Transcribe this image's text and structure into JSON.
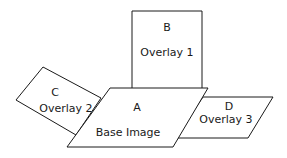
{
  "diagram": {
    "shapes": {
      "a": {
        "letter": "A",
        "label": "Base Image"
      },
      "b": {
        "letter": "B",
        "label": "Overlay 1"
      },
      "c": {
        "letter": "C",
        "label": "Overlay 2"
      },
      "d": {
        "letter": "D",
        "label": "Overlay 3"
      }
    },
    "colors": {
      "stroke": "#1a1a1a",
      "fill": "#ffffff",
      "background": "#ffffff"
    }
  }
}
